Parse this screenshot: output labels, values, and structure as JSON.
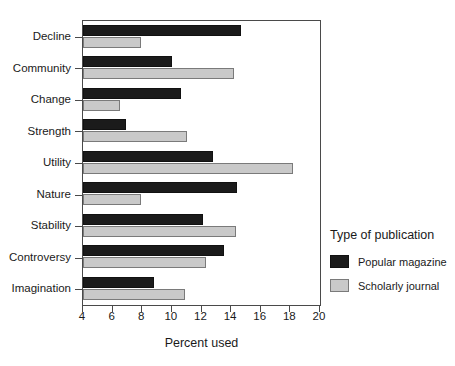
{
  "chart_data": {
    "type": "bar",
    "orientation": "horizontal",
    "title": "",
    "xlabel": "Percent used",
    "ylabel": "",
    "xlim": [
      4,
      20
    ],
    "xticks": [
      4,
      6,
      8,
      10,
      12,
      14,
      16,
      18,
      20
    ],
    "grid": false,
    "legend_position": "right",
    "legend_title": "Type of publication",
    "categories": [
      "Decline",
      "Community",
      "Change",
      "Strength",
      "Utility",
      "Nature",
      "Stability",
      "Controversy",
      "Imagination"
    ],
    "series": [
      {
        "name": "Popular magazine",
        "color": "#1b1b1b",
        "values": [
          14.7,
          10.0,
          10.6,
          6.9,
          12.8,
          14.4,
          12.1,
          13.5,
          8.8
        ]
      },
      {
        "name": "Scholarly journal",
        "color": "#c9c9c9",
        "values": [
          7.9,
          14.2,
          6.5,
          11.0,
          18.2,
          7.9,
          14.3,
          12.3,
          10.9
        ]
      }
    ]
  }
}
